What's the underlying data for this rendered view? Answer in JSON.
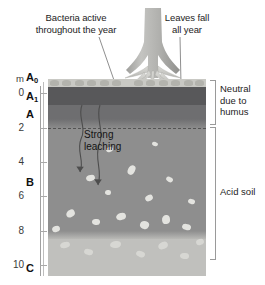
{
  "figure": {
    "type": "soil-profile-diagram"
  },
  "captions": {
    "left": "Bacteria active throughout the year",
    "left_line1": "Bacteria active",
    "left_line2": "throughout the year",
    "right": "Leaves fall all year",
    "right_line1": "Leaves fall",
    "right_line2": "all year",
    "inner_line1": "Strong",
    "inner_line2": "leaching"
  },
  "scale": {
    "unit": "m",
    "ticks": [
      "0",
      "2",
      "4",
      "6",
      "8",
      "10"
    ],
    "values": [
      0,
      2,
      4,
      6,
      8,
      10
    ],
    "min": 0,
    "max": 10
  },
  "horizons": [
    {
      "id": "A0",
      "letter": "A",
      "sub": "0",
      "label": "A₀"
    },
    {
      "id": "A1",
      "letter": "A",
      "sub": "1",
      "label": "A₁"
    },
    {
      "id": "A",
      "letter": "A",
      "sub": "",
      "label": "A"
    },
    {
      "id": "B",
      "letter": "B",
      "sub": "",
      "label": "B"
    },
    {
      "id": "C",
      "letter": "C",
      "sub": "",
      "label": "C"
    }
  ],
  "annotations": {
    "neutral_line1": "Neutral",
    "neutral_line2": "due to",
    "neutral_line3": "humus",
    "acid": "Acid soil"
  },
  "colors": {
    "litter": "#c9c9c4",
    "humus": "#58585a",
    "a_horizon": "#6e6e70",
    "b_horizon": "#8e8e8e",
    "c_horizon": "#c0c0bd",
    "stone": "#e8e8e4",
    "tree": "#b5b5b2",
    "background": "#ffffff",
    "text": "#1a1a1a",
    "rule": "#9a9a9a"
  }
}
